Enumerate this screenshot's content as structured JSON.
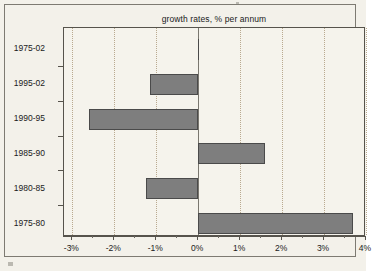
{
  "chart_data": {
    "type": "bar",
    "orientation": "horizontal",
    "title": "growth rates, % per annum",
    "xlabel": "",
    "ylabel": "",
    "categories": [
      "1975-02",
      "1995-02",
      "1990-95",
      "1985-90",
      "1980-85",
      "1975-80"
    ],
    "values": [
      0.0,
      -1.15,
      -2.6,
      1.6,
      -1.25,
      3.7
    ],
    "xlim": [
      -3.2,
      4.0
    ],
    "xticks": [
      -3,
      -2,
      -1,
      0,
      1,
      2,
      3,
      4
    ],
    "xticklabels": [
      "-3%",
      "-2%",
      "-1%",
      "0%",
      "1%",
      "2%",
      "3%",
      "4%"
    ],
    "grid": true,
    "grid_axis": "x",
    "legend": null,
    "bar_color": "#7e7e7e",
    "bar_edge_color": "#4a4a4a",
    "background_color": "#f3f1ea",
    "plot_background_color": "#f5f3ec"
  },
  "axis": {
    "tick_labels": [
      "-3%",
      "-2%",
      "-1%",
      "0%",
      "1%",
      "2%",
      "3%",
      "4%"
    ],
    "category_labels": [
      "1975-02",
      "1995-02",
      "1990-95",
      "1985-90",
      "1980-85",
      "1975-80"
    ]
  },
  "title": "growth rates, % per annum"
}
